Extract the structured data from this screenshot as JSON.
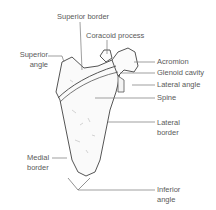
{
  "diagram": {
    "labels": {
      "superior_border": "Superior border",
      "coracoid_process": "Coracoid process",
      "superior_angle": "Superior\nangle",
      "acromion": "Acromion",
      "glenoid_cavity": "Glenoid cavity",
      "lateral_angle": "Lateral angle",
      "spine": "Spine",
      "lateral_border": "Lateral\nborder",
      "medial_border": "Medial\nborder",
      "inferior_angle": "Inferior\nangle"
    },
    "colors": {
      "outline": "#555555",
      "label": "#5a5a5a",
      "leader": "#777777"
    }
  }
}
